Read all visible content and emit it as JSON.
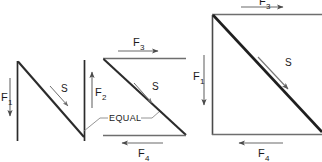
{
  "figure": {
    "background_color": "#ffffff",
    "line_color": "#2b2b2b",
    "thin_line_color": "#7a7a7a",
    "text_color": "#1a1a1a"
  },
  "panels": [
    {
      "id": "panel-left",
      "name": "vertical-shear-couple",
      "labels": {
        "f1": "F",
        "f1_sub": "1",
        "f2": "F",
        "f2_sub": "2",
        "s": "S",
        "equal": "EQUAL"
      }
    },
    {
      "id": "panel-middle",
      "name": "horizontal-shear-couple",
      "labels": {
        "f3": "F",
        "f3_sub": "3",
        "f4": "F",
        "f4_sub": "4",
        "s": "S",
        "equal": "EQUAL"
      }
    },
    {
      "id": "panel-right",
      "name": "combined-shear-square",
      "labels": {
        "f1": "F",
        "f1_sub": "1",
        "f3": "F",
        "f3_sub": "3",
        "f4": "F",
        "f4_sub": "4",
        "s": "S"
      }
    }
  ],
  "annotations": {
    "equal_text": "EQUAL"
  }
}
